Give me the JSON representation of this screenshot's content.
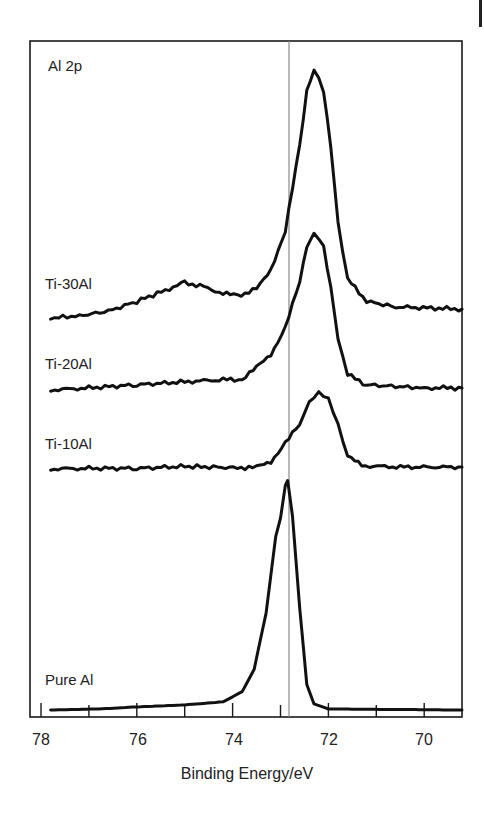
{
  "chart_data": {
    "type": "line",
    "title": "Al 2p",
    "xlabel": "Binding Energy/eV",
    "ylabel": "",
    "xlim": [
      78.2,
      69.2
    ],
    "x_reversed": true,
    "x_ticks_major": [
      78,
      76,
      74,
      72,
      70
    ],
    "x_ticks_minor": [
      77,
      75,
      73,
      71
    ],
    "y_ticks": [],
    "grid": false,
    "legend": "inline labels left",
    "reference_line_x": 72.85,
    "series": [
      {
        "name": "Ti-30Al",
        "label_x": 45,
        "label_y": 284,
        "points": [
          [
            77.8,
            0.0
          ],
          [
            77.2,
            0.02
          ],
          [
            76.6,
            0.06
          ],
          [
            76.0,
            0.15
          ],
          [
            75.4,
            0.25
          ],
          [
            75.0,
            0.32
          ],
          [
            74.6,
            0.28
          ],
          [
            74.2,
            0.22
          ],
          [
            73.9,
            0.2
          ],
          [
            73.5,
            0.26
          ],
          [
            73.2,
            0.44
          ],
          [
            72.9,
            0.78
          ],
          [
            72.6,
            1.55
          ],
          [
            72.45,
            2.05
          ],
          [
            72.3,
            2.25
          ],
          [
            72.1,
            2.05
          ],
          [
            71.95,
            1.55
          ],
          [
            71.8,
            0.85
          ],
          [
            71.6,
            0.35
          ],
          [
            71.2,
            0.15
          ],
          [
            70.6,
            0.1
          ],
          [
            69.2,
            0.08
          ]
        ]
      },
      {
        "name": "Ti-20Al",
        "label_x": 45,
        "label_y": 364,
        "points": [
          [
            77.8,
            0.0
          ],
          [
            77.0,
            0.02
          ],
          [
            76.0,
            0.05
          ],
          [
            75.0,
            0.08
          ],
          [
            74.2,
            0.1
          ],
          [
            73.8,
            0.1
          ],
          [
            73.5,
            0.22
          ],
          [
            73.2,
            0.35
          ],
          [
            72.9,
            0.6
          ],
          [
            72.6,
            1.05
          ],
          [
            72.45,
            1.4
          ],
          [
            72.3,
            1.52
          ],
          [
            72.1,
            1.4
          ],
          [
            71.95,
            1.0
          ],
          [
            71.8,
            0.5
          ],
          [
            71.6,
            0.15
          ],
          [
            71.2,
            0.05
          ],
          [
            70.0,
            0.02
          ],
          [
            69.2,
            0.02
          ]
        ]
      },
      {
        "name": "Ti-10Al",
        "label_x": 45,
        "label_y": 444,
        "points": [
          [
            77.8,
            0.0
          ],
          [
            77.0,
            0.01
          ],
          [
            76.0,
            0.01
          ],
          [
            75.0,
            0.04
          ],
          [
            74.4,
            0.03
          ],
          [
            73.9,
            0.02
          ],
          [
            73.5,
            0.03
          ],
          [
            73.2,
            0.12
          ],
          [
            72.9,
            0.4
          ],
          [
            72.6,
            0.7
          ],
          [
            72.4,
            1.05
          ],
          [
            72.2,
            1.2
          ],
          [
            72.0,
            1.1
          ],
          [
            71.8,
            0.7
          ],
          [
            71.6,
            0.2
          ],
          [
            71.3,
            0.05
          ],
          [
            70.5,
            0.03
          ],
          [
            69.2,
            0.03
          ]
        ]
      },
      {
        "name": "Pure Al",
        "label_x": 45,
        "label_y": 680,
        "points": [
          [
            77.8,
            0.0
          ],
          [
            76.8,
            0.01
          ],
          [
            76.0,
            0.03
          ],
          [
            75.0,
            0.05
          ],
          [
            74.2,
            0.08
          ],
          [
            73.8,
            0.18
          ],
          [
            73.55,
            0.4
          ],
          [
            73.3,
            0.95
          ],
          [
            73.1,
            1.7
          ],
          [
            73.0,
            1.88
          ],
          [
            72.9,
            2.2
          ],
          [
            72.85,
            2.25
          ],
          [
            72.75,
            1.9
          ],
          [
            72.6,
            1.0
          ],
          [
            72.45,
            0.25
          ],
          [
            72.3,
            0.06
          ],
          [
            72.0,
            0.01
          ],
          [
            69.2,
            0.0
          ]
        ]
      }
    ],
    "label_title": "Al 2p"
  },
  "labels": {
    "title": "Al 2p",
    "xlabel": "Binding Energy/eV",
    "ticks": [
      "78",
      "76",
      "74",
      "72",
      "70"
    ],
    "series": [
      "Ti-30Al",
      "Ti-20Al",
      "Ti-10Al",
      "Pure Al"
    ]
  }
}
